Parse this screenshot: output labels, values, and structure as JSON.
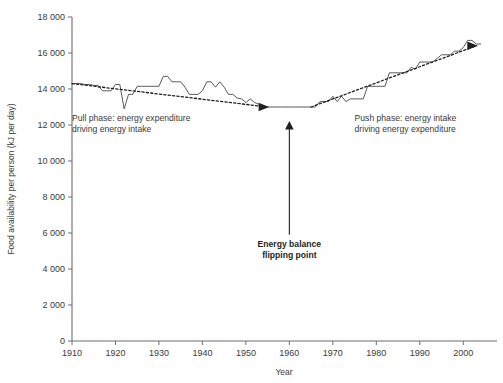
{
  "chart_data": {
    "type": "line",
    "title": "",
    "xlabel": "Year",
    "ylabel": "Food availability per person (kJ per day)",
    "xlim": [
      1910,
      2005
    ],
    "ylim": [
      0,
      18000
    ],
    "grid": false,
    "legend": "none",
    "x_ticks": [
      1910,
      1920,
      1930,
      1940,
      1950,
      1960,
      1970,
      1980,
      1990,
      2000
    ],
    "x_tick_labels": [
      "1910",
      "1920",
      "1930",
      "1940",
      "1950",
      "1960",
      "1970",
      "1980",
      "1990",
      "2000"
    ],
    "y_ticks": [
      0,
      2000,
      4000,
      6000,
      8000,
      10000,
      12000,
      14000,
      16000,
      18000
    ],
    "y_tick_labels": [
      "0",
      "2000",
      "4000",
      "6000",
      "8000",
      "10000",
      "12000",
      "14000",
      "16000",
      "18000"
    ],
    "series": [
      {
        "name": "Food availability per person",
        "style": "solid",
        "color": "#58595b",
        "x": [
          1910,
          1911,
          1912,
          1913,
          1914,
          1915,
          1916,
          1917,
          1918,
          1919,
          1920,
          1921,
          1922,
          1923,
          1924,
          1925,
          1926,
          1927,
          1928,
          1929,
          1930,
          1931,
          1932,
          1933,
          1934,
          1935,
          1936,
          1937,
          1938,
          1939,
          1940,
          1941,
          1942,
          1943,
          1944,
          1945,
          1946,
          1947,
          1948,
          1949,
          1950,
          1951,
          1952,
          1953,
          1954,
          1955,
          1956,
          1957,
          1958,
          1959,
          1960,
          1961,
          1962,
          1963,
          1964,
          1965,
          1966,
          1967,
          1968,
          1969,
          1970,
          1971,
          1972,
          1973,
          1974,
          1975,
          1976,
          1977,
          1978,
          1979,
          1980,
          1981,
          1982,
          1983,
          1984,
          1985,
          1986,
          1987,
          1988,
          1989,
          1990,
          1991,
          1992,
          1993,
          1994,
          1995,
          1996,
          1997,
          1998,
          1999,
          2000,
          2001,
          2002,
          2003,
          2004
        ],
        "values": [
          14300,
          14300,
          14300,
          14250,
          14250,
          14200,
          14200,
          13900,
          13900,
          13900,
          14250,
          14250,
          12900,
          13700,
          13700,
          14150,
          14150,
          14150,
          14150,
          14150,
          14150,
          14700,
          14700,
          14400,
          14400,
          14400,
          14100,
          13700,
          13700,
          13700,
          13900,
          14400,
          14400,
          14100,
          14400,
          14100,
          13700,
          13700,
          13500,
          13450,
          13250,
          13450,
          13250,
          13150,
          13000,
          13000,
          13000,
          13000,
          13000,
          13000,
          13000,
          13000,
          13000,
          13000,
          13000,
          13000,
          13000,
          13300,
          13300,
          13300,
          13600,
          13300,
          13600,
          13300,
          13450,
          13450,
          13450,
          13450,
          14150,
          14150,
          14150,
          14150,
          14150,
          14900,
          14900,
          14900,
          14900,
          14900,
          15200,
          15100,
          15500,
          15500,
          15500,
          15500,
          15700,
          15900,
          15900,
          15900,
          16100,
          16100,
          16300,
          16700,
          16700,
          16500,
          16500
        ]
      },
      {
        "name": "Pull phase trend",
        "style": "dashed",
        "color": "#231f20",
        "x": [
          1910,
          1955
        ],
        "values": [
          14300,
          13000
        ]
      },
      {
        "name": "Push phase trend",
        "style": "dashed",
        "color": "#231f20",
        "x": [
          1965,
          2003
        ],
        "values": [
          13000,
          16400
        ]
      }
    ],
    "annotations": [
      {
        "name": "pull-phase-annotation",
        "lines": [
          "Pull phase: energy expenditure",
          "driving energy intake"
        ],
        "x": 1910,
        "y": 12200
      },
      {
        "name": "push-phase-annotation",
        "lines": [
          "Push phase: energy intake",
          "driving energy expenditure"
        ],
        "x": 1975,
        "y": 12250
      },
      {
        "name": "flipping-point-annotation",
        "lines": [
          "Energy balance",
          "flipping point"
        ],
        "x": 1960,
        "y": 5200,
        "bold": true
      }
    ],
    "arrows": [
      {
        "name": "pull-phase-arrowhead",
        "direction": "right",
        "x": 1955,
        "y": 13000
      },
      {
        "name": "push-phase-arrowhead",
        "direction": "right",
        "x": 2003,
        "y": 16400
      },
      {
        "name": "flipping-point-arrow",
        "direction": "up",
        "x": 1960,
        "y_from": 5900,
        "y_to": 12200
      }
    ]
  },
  "colors": {
    "series": "#58595b",
    "trend": "#231f20",
    "axis": "#6d6e71",
    "text": "#3a3a3a",
    "background": "#ffffff"
  }
}
